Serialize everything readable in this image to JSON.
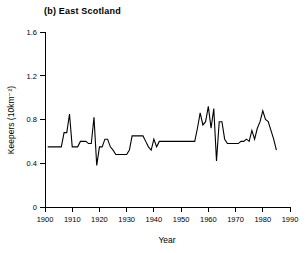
{
  "figure": {
    "panel_label": "(b) East Scotland",
    "background_color": "#ffffff",
    "line_color": "#000000"
  },
  "chart_data": {
    "type": "line",
    "title": "(b) East Scotland",
    "xlabel": "Year",
    "ylabel": "Keepers (10km⁻²)",
    "xlim": [
      1900,
      1990
    ],
    "ylim": [
      0,
      1.6
    ],
    "xticks": [
      1900,
      1910,
      1920,
      1930,
      1940,
      1950,
      1960,
      1970,
      1980,
      1990
    ],
    "xticklabels": [
      "1900",
      "1910",
      "1920",
      "1930",
      "1940",
      "1950",
      "1960",
      "1970",
      "1980",
      "1990"
    ],
    "yticks": [
      0,
      0.4,
      0.8,
      1.2,
      1.6
    ],
    "yticklabels": [
      "0",
      "0.4",
      "0.8",
      "1.2",
      "1.6"
    ],
    "grid": false,
    "legend": false,
    "series": [
      {
        "name": "East Scotland",
        "x": [
          1901,
          1902,
          1903,
          1904,
          1905,
          1906,
          1907,
          1908,
          1909,
          1910,
          1911,
          1912,
          1913,
          1914,
          1915,
          1916,
          1917,
          1918,
          1919,
          1920,
          1921,
          1922,
          1923,
          1924,
          1925,
          1926,
          1927,
          1928,
          1929,
          1930,
          1931,
          1932,
          1933,
          1934,
          1935,
          1936,
          1937,
          1938,
          1939,
          1940,
          1941,
          1942,
          1943,
          1944,
          1945,
          1946,
          1947,
          1948,
          1949,
          1950,
          1951,
          1952,
          1953,
          1954,
          1955,
          1956,
          1957,
          1958,
          1959,
          1960,
          1961,
          1962,
          1963,
          1964,
          1965,
          1966,
          1967,
          1968,
          1969,
          1970,
          1971,
          1972,
          1973,
          1974,
          1975,
          1976,
          1977,
          1978,
          1979,
          1980,
          1981,
          1982,
          1983,
          1984,
          1985
        ],
        "y": [
          0.55,
          0.55,
          0.55,
          0.55,
          0.55,
          0.55,
          0.68,
          0.68,
          0.85,
          0.55,
          0.55,
          0.55,
          0.6,
          0.6,
          0.6,
          0.58,
          0.58,
          0.82,
          0.38,
          0.55,
          0.55,
          0.62,
          0.62,
          0.55,
          0.52,
          0.48,
          0.48,
          0.48,
          0.48,
          0.48,
          0.52,
          0.65,
          0.65,
          0.65,
          0.65,
          0.65,
          0.6,
          0.55,
          0.52,
          0.62,
          0.55,
          0.6,
          0.6,
          0.6,
          0.6,
          0.6,
          0.6,
          0.6,
          0.6,
          0.6,
          0.6,
          0.6,
          0.6,
          0.6,
          0.6,
          0.72,
          0.86,
          0.75,
          0.78,
          0.92,
          0.72,
          0.9,
          0.42,
          0.78,
          0.78,
          0.62,
          0.58,
          0.58,
          0.58,
          0.58,
          0.58,
          0.6,
          0.6,
          0.62,
          0.6,
          0.7,
          0.62,
          0.72,
          0.78,
          0.88,
          0.8,
          0.78,
          0.7,
          0.62,
          0.52
        ]
      }
    ]
  }
}
